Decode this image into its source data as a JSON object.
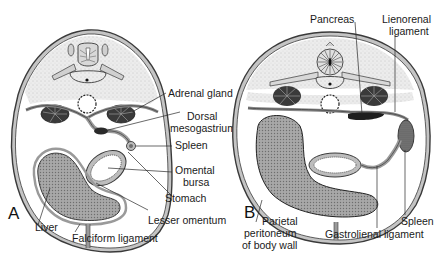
{
  "figure": {
    "panels": [
      {
        "id": "A",
        "letter": "A",
        "labels": {
          "adrenal_gland": "Adrenal gland",
          "dorsal_1": "Dorsal",
          "dorsal_2": "mesogastrium",
          "spleen": "Spleen",
          "omental_1": "Omental",
          "omental_2": "bursa",
          "stomach": "Stomach",
          "lesser_omentum": "Lesser omentum",
          "liver": "Liver",
          "falciform": "Falciform ligament"
        }
      },
      {
        "id": "B",
        "letter": "B",
        "labels": {
          "pancreas": "Pancreas",
          "lienorenal_1": "Lienorenal",
          "lienorenal_2": "ligament",
          "spleen": "Spleen",
          "gastrolienal": "Gastrolienal ligament",
          "parietal_1": "Parietal",
          "parietal_2": "peritoneum",
          "parietal_3": "of body wall"
        }
      }
    ],
    "colors": {
      "outline": "#3a3a3a",
      "wall_fill": "#bdbdbd",
      "stipple": "#e6e6e6",
      "liver_fill": "#9a9a9a",
      "dark_organ": "#2a2a2a"
    }
  }
}
